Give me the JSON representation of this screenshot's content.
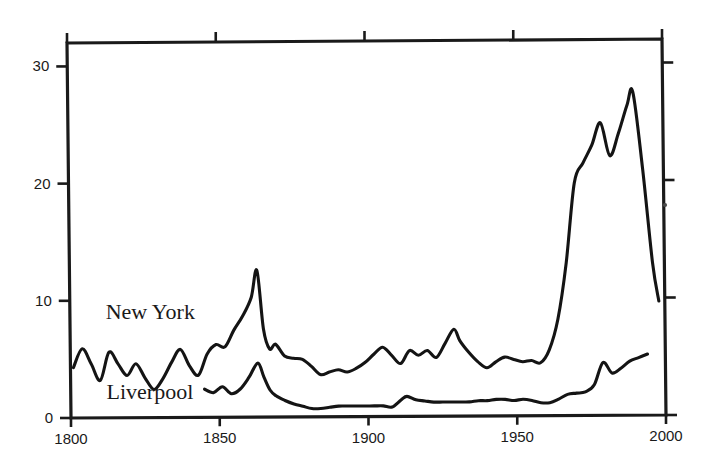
{
  "chart_data": {
    "type": "line",
    "title": "",
    "subtitle": "",
    "xlabel": "",
    "ylabel": "",
    "xlim": [
      1800,
      2000
    ],
    "ylim": [
      0,
      32
    ],
    "grid": false,
    "legend_position": "inline-annotation",
    "xticks": [
      1800,
      1850,
      1900,
      1950,
      2000
    ],
    "xtick_labels": [
      "1800",
      "1850",
      "1900",
      "1950",
      "2000"
    ],
    "yticks": [
      0,
      10,
      20,
      30
    ],
    "ytick_labels": [
      "0",
      "10",
      "20",
      "30"
    ],
    "annotations": [
      {
        "text": "New York",
        "x": 1812,
        "y": 8.4
      },
      {
        "text": "Liverpool",
        "x": 1812,
        "y": 1.6
      }
    ],
    "series": [
      {
        "name": "New York",
        "x": [
          1801,
          1804,
          1807,
          1810,
          1813,
          1816,
          1819,
          1822,
          1825,
          1828,
          1831,
          1834,
          1837,
          1840,
          1843,
          1846,
          1849,
          1852,
          1855,
          1858,
          1861,
          1863,
          1865,
          1867,
          1869,
          1872,
          1875,
          1878,
          1881,
          1884,
          1887,
          1890,
          1893,
          1896,
          1899,
          1902,
          1905,
          1908,
          1911,
          1914,
          1917,
          1920,
          1923,
          1926,
          1929,
          1931,
          1934,
          1937,
          1940,
          1943,
          1946,
          1949,
          1952,
          1955,
          1958,
          1961,
          1964,
          1967,
          1970,
          1973,
          1976,
          1979,
          1982,
          1985,
          1988,
          1990,
          1993,
          1996,
          1998
        ],
        "values": [
          4.3,
          5.9,
          4.6,
          3.2,
          5.6,
          4.6,
          3.6,
          4.6,
          3.4,
          2.4,
          3.3,
          4.7,
          5.8,
          4.4,
          3.6,
          5.4,
          6.2,
          6.0,
          7.4,
          8.6,
          10.2,
          12.5,
          7.5,
          5.8,
          6.2,
          5.2,
          5.0,
          4.9,
          4.3,
          3.6,
          3.8,
          4.0,
          3.8,
          4.1,
          4.6,
          5.3,
          5.9,
          5.2,
          4.5,
          5.6,
          5.2,
          5.6,
          5.0,
          6.2,
          7.4,
          6.4,
          5.4,
          4.6,
          4.1,
          4.6,
          5.0,
          4.8,
          4.6,
          4.7,
          4.5,
          5.6,
          8.2,
          13.0,
          19.8,
          21.5,
          23.0,
          24.9,
          22.1,
          24.0,
          26.4,
          27.5,
          21.0,
          13.0,
          9.7
        ]
      },
      {
        "name": "Liverpool",
        "x": [
          1845,
          1848,
          1851,
          1854,
          1857,
          1860,
          1863,
          1865,
          1867,
          1869,
          1872,
          1875,
          1878,
          1881,
          1884,
          1887,
          1890,
          1893,
          1896,
          1899,
          1902,
          1905,
          1908,
          1911,
          1913,
          1916,
          1919,
          1922,
          1925,
          1928,
          1931,
          1934,
          1937,
          1940,
          1943,
          1946,
          1949,
          1952,
          1955,
          1958,
          1961,
          1964,
          1967,
          1970,
          1973,
          1976,
          1979,
          1982,
          1985,
          1988,
          1991,
          1994
        ],
        "values": [
          2.4,
          2.1,
          2.6,
          2.0,
          2.4,
          3.4,
          4.6,
          3.4,
          2.3,
          1.8,
          1.4,
          1.1,
          0.9,
          0.7,
          0.7,
          0.8,
          0.9,
          0.9,
          0.9,
          0.9,
          0.9,
          0.9,
          0.8,
          1.4,
          1.7,
          1.4,
          1.3,
          1.2,
          1.2,
          1.2,
          1.2,
          1.2,
          1.3,
          1.3,
          1.4,
          1.4,
          1.3,
          1.4,
          1.3,
          1.1,
          1.1,
          1.4,
          1.8,
          1.9,
          2.0,
          2.6,
          4.5,
          3.6,
          4.0,
          4.6,
          4.9,
          5.2
        ]
      }
    ]
  },
  "colors": {
    "ink": "#141414",
    "background": "#ffffff"
  }
}
